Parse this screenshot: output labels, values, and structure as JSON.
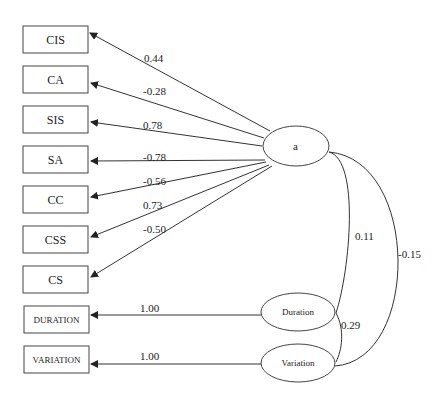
{
  "diagram": {
    "type": "path-diagram",
    "observed": [
      {
        "label": "CIS",
        "coef": "0.44"
      },
      {
        "label": "CA",
        "coef": "-0.28"
      },
      {
        "label": "SIS",
        "coef": "0.78"
      },
      {
        "label": "SA",
        "coef": "-0.78"
      },
      {
        "label": "CC",
        "coef": "-0.56"
      },
      {
        "label": "CSS",
        "coef": "0.73"
      },
      {
        "label": "CS",
        "coef": "-0.50"
      },
      {
        "label": "DURATION",
        "coef": "1.00"
      },
      {
        "label": "VARIATION",
        "coef": "1.00"
      }
    ],
    "latent": {
      "a": "a",
      "duration": "Duration",
      "variation": "Variation"
    },
    "covariances": {
      "a_duration": "0.11",
      "a_variation": "-0.15",
      "duration_variation": "0.29"
    }
  }
}
